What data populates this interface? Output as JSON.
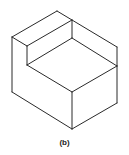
{
  "figure": {
    "caption": "(b)",
    "stroke_color": "#2a2a2a",
    "vertices": {
      "top": [
        57,
        11
      ],
      "top_inner_right": [
        72,
        20
      ],
      "left_top": [
        12,
        37
      ],
      "step_corner": [
        27,
        46
      ],
      "inner_mid": [
        72,
        38
      ],
      "right_top": [
        117,
        47
      ],
      "right_mid": [
        117,
        66
      ],
      "step_bottom": [
        27,
        65
      ],
      "center": [
        72,
        92
      ],
      "left_bottom": [
        12,
        92
      ],
      "bottom": [
        72,
        129
      ],
      "right_bottom": [
        117,
        103
      ]
    }
  }
}
